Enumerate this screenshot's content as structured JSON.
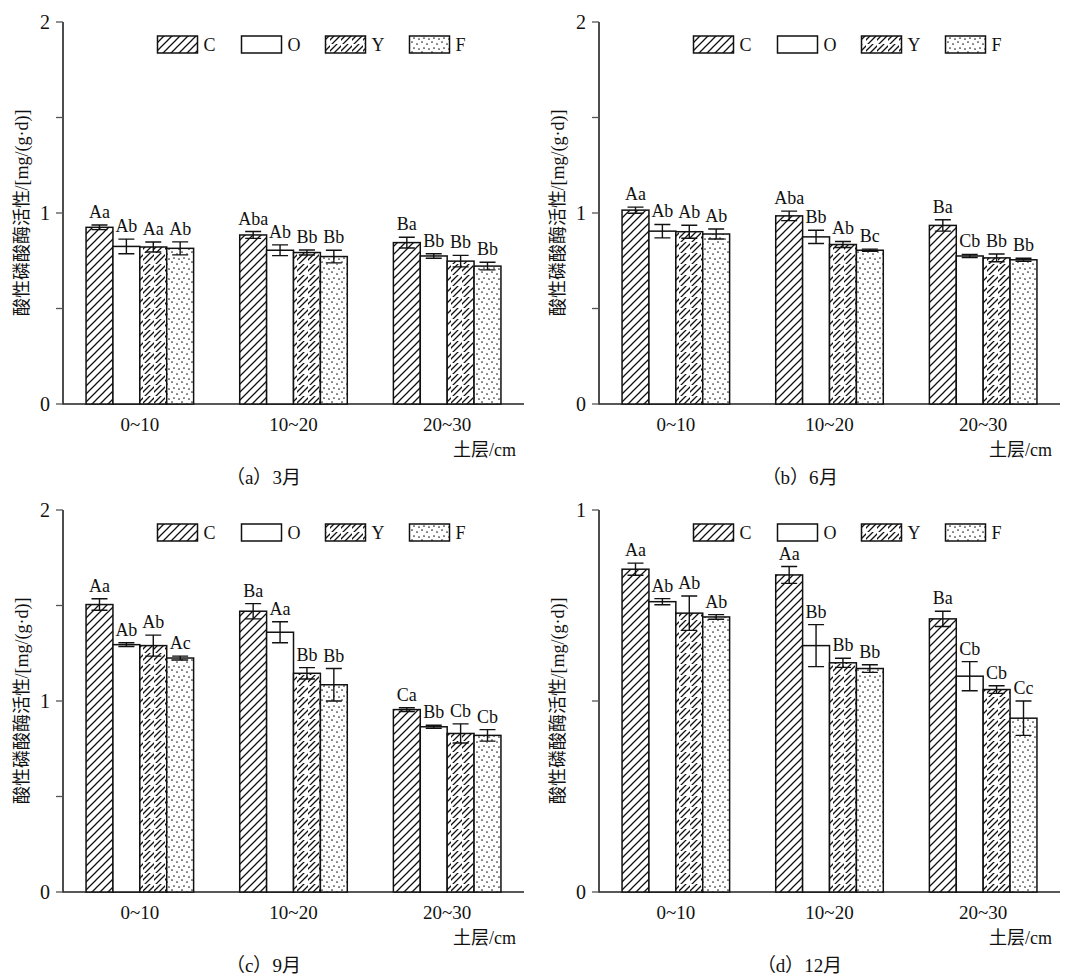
{
  "figure": {
    "y_axis_label": "酸性磷酸酶活性/[mg/(g·d)]",
    "x_axis_label": "土层/cm",
    "categories": [
      "0~10",
      "10~20",
      "20~30"
    ],
    "legend": [
      {
        "key": "C",
        "label": "C",
        "pattern": "hatch-dense-back"
      },
      {
        "key": "O",
        "label": "O",
        "pattern": "solid-white"
      },
      {
        "key": "Y",
        "label": "Y",
        "pattern": "hatch-sparse-forward"
      },
      {
        "key": "F",
        "label": "F",
        "pattern": "dots"
      }
    ]
  },
  "chart_data": [
    {
      "id": "a",
      "type": "bar",
      "title": "（a）3月",
      "caption": "（a）3月",
      "xlabel": "土层/cm",
      "ylabel": "酸性磷酸酶活性/[mg/(g·d)]",
      "ylim": [
        0,
        2
      ],
      "yticks": [
        0,
        0.5,
        1,
        1.5,
        2
      ],
      "ytick_labels": [
        "0",
        "",
        "1",
        "",
        "2"
      ],
      "grid": false,
      "legend_position": "top-center",
      "categories": [
        "0~10",
        "10~20",
        "20~30"
      ],
      "series": [
        {
          "name": "C",
          "values": [
            0.925,
            0.885,
            0.845
          ],
          "errors": [
            0.012,
            0.018,
            0.028
          ]
        },
        {
          "name": "O",
          "values": [
            0.825,
            0.805,
            0.775
          ],
          "errors": [
            0.038,
            0.028,
            0.012
          ]
        },
        {
          "name": "Y",
          "values": [
            0.822,
            0.793,
            0.748
          ],
          "errors": [
            0.026,
            0.013,
            0.03
          ]
        },
        {
          "name": "F",
          "values": [
            0.815,
            0.772,
            0.722
          ],
          "errors": [
            0.034,
            0.033,
            0.02
          ]
        }
      ],
      "annotations": [
        [
          "Aa",
          "Ab",
          "Aa",
          "Ab"
        ],
        [
          "Aba",
          "Ab",
          "Bb",
          "Bb"
        ],
        [
          "Ba",
          "Bb",
          "Bb",
          "Bb"
        ]
      ]
    },
    {
      "id": "b",
      "type": "bar",
      "title": "（b）6月",
      "caption": "（b）6月",
      "xlabel": "土层/cm",
      "ylabel": "酸性磷酸酶活性/[mg/(g·d)]",
      "ylim": [
        0,
        2
      ],
      "yticks": [
        0,
        0.5,
        1,
        1.5,
        2
      ],
      "ytick_labels": [
        "0",
        "",
        "1",
        "",
        "2"
      ],
      "grid": false,
      "legend_position": "top-center",
      "categories": [
        "0~10",
        "10~20",
        "20~30"
      ],
      "series": [
        {
          "name": "C",
          "values": [
            1.015,
            0.985,
            0.935
          ],
          "errors": [
            0.016,
            0.025,
            0.03
          ]
        },
        {
          "name": "O",
          "values": [
            0.905,
            0.875,
            0.775
          ],
          "errors": [
            0.035,
            0.035,
            0.008
          ]
        },
        {
          "name": "Y",
          "values": [
            0.902,
            0.835,
            0.765
          ],
          "errors": [
            0.034,
            0.016,
            0.02
          ]
        },
        {
          "name": "F",
          "values": [
            0.89,
            0.805,
            0.755
          ],
          "errors": [
            0.026,
            0.006,
            0.008
          ]
        }
      ],
      "annotations": [
        [
          "Aa",
          "Ab",
          "Ab",
          "Ab"
        ],
        [
          "Aba",
          "Bb",
          "Ab",
          "Bc"
        ],
        [
          "Ba",
          "Cb",
          "Bb",
          "Bb"
        ]
      ]
    },
    {
      "id": "c",
      "type": "bar",
      "title": "（c）9月",
      "caption": "（c）9月",
      "xlabel": "土层/cm",
      "ylabel": "酸性磷酸酶活性/[mg/(g·d)]",
      "ylim": [
        0,
        2
      ],
      "yticks": [
        0,
        0.5,
        1,
        1.5,
        2
      ],
      "ytick_labels": [
        "0",
        "",
        "1",
        "",
        "2"
      ],
      "grid": false,
      "legend_position": "top-center",
      "categories": [
        "0~10",
        "10~20",
        "20~30"
      ],
      "series": [
        {
          "name": "C",
          "values": [
            1.505,
            1.47,
            0.955
          ],
          "errors": [
            0.03,
            0.04,
            0.01
          ]
        },
        {
          "name": "O",
          "values": [
            1.295,
            1.36,
            0.865
          ],
          "errors": [
            0.01,
            0.055,
            0.008
          ]
        },
        {
          "name": "Y",
          "values": [
            1.29,
            1.145,
            0.83
          ],
          "errors": [
            0.055,
            0.03,
            0.05
          ]
        },
        {
          "name": "F",
          "values": [
            1.225,
            1.085,
            0.82
          ],
          "errors": [
            0.01,
            0.085,
            0.03
          ]
        }
      ],
      "annotations": [
        [
          "Aa",
          "Ab",
          "Ab",
          "Ac"
        ],
        [
          "Ba",
          "Aa",
          "Bb",
          "Bb"
        ],
        [
          "Ca",
          "Bb",
          "Cb",
          "Cb"
        ]
      ]
    },
    {
      "id": "d",
      "type": "bar",
      "title": "（d）12月",
      "caption": "（d）12月",
      "xlabel": "土层/cm",
      "ylabel": "酸性磷酸酶活性/[mg/(g·d)]",
      "ylim": [
        0,
        1
      ],
      "yticks": [
        0,
        0.5,
        1
      ],
      "ytick_labels": [
        "0",
        "",
        "1"
      ],
      "grid": false,
      "legend_position": "top-center",
      "categories": [
        "0~10",
        "10~20",
        "20~30"
      ],
      "series": [
        {
          "name": "C",
          "values": [
            0.845,
            0.83,
            0.715
          ],
          "errors": [
            0.016,
            0.022,
            0.02
          ]
        },
        {
          "name": "O",
          "values": [
            0.76,
            0.645,
            0.565
          ],
          "errors": [
            0.008,
            0.055,
            0.038
          ]
        },
        {
          "name": "Y",
          "values": [
            0.73,
            0.6,
            0.53
          ],
          "errors": [
            0.045,
            0.012,
            0.01
          ]
        },
        {
          "name": "F",
          "values": [
            0.72,
            0.585,
            0.455
          ],
          "errors": [
            0.006,
            0.01,
            0.045
          ]
        }
      ],
      "annotations": [
        [
          "Aa",
          "Ab",
          "Ab",
          "Ab"
        ],
        [
          "Aa",
          "Bb",
          "Bb",
          "Bb"
        ],
        [
          "Ba",
          "Cb",
          "Cb",
          "Cc"
        ]
      ]
    }
  ]
}
